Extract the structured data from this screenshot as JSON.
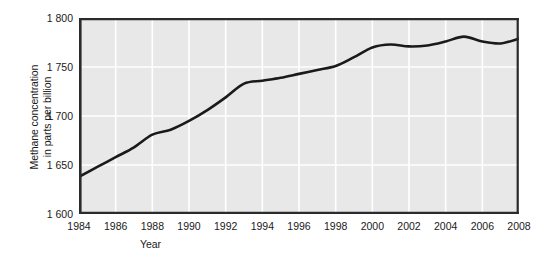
{
  "chart_data": {
    "type": "line",
    "title": "",
    "xlabel": "Year",
    "ylabel": "Methane concentration in parts per billion",
    "ylabel_lines": [
      "Methane concentration",
      "in parts per billion"
    ],
    "xlim": [
      1984,
      2008
    ],
    "ylim": [
      1600,
      1800
    ],
    "grid": true,
    "legend": "none",
    "xticks": [
      1984,
      1986,
      1988,
      1990,
      1992,
      1994,
      1996,
      1998,
      2000,
      2002,
      2004,
      2006,
      2008
    ],
    "xtick_labels": [
      "1984",
      "1986",
      "1988",
      "1990",
      "1992",
      "1994",
      "1996",
      "1998",
      "2000",
      "2002",
      "2004",
      "2006",
      "2008"
    ],
    "yticks": [
      1600,
      1650,
      1700,
      1750,
      1800
    ],
    "ytick_labels": [
      "1 600",
      "1 650",
      "1 700",
      "1 750",
      "1 800"
    ],
    "series": [
      {
        "name": "Methane concentration",
        "color": "#1a1a1a",
        "x": [
          1984,
          1985,
          1986,
          1987,
          1988,
          1989,
          1990,
          1991,
          1992,
          1993,
          1994,
          1995,
          1996,
          1997,
          1998,
          1999,
          2000,
          2001,
          2002,
          2003,
          2004,
          2005,
          2006,
          2007,
          2008
        ],
        "values": [
          1638,
          1648,
          1658,
          1668,
          1681,
          1686,
          1695,
          1706,
          1719,
          1733,
          1736,
          1739,
          1743,
          1747,
          1751,
          1760,
          1770,
          1773,
          1771,
          1772,
          1776,
          1781,
          1776,
          1774,
          1779
        ]
      }
    ]
  },
  "axes": {
    "plot_background": "#e8e8e8",
    "grid_color": "#ffffff",
    "frame_color": "#2b2b2b",
    "line_color": "#1a1a1a"
  },
  "caption": {
    "clipped_text": ""
  }
}
